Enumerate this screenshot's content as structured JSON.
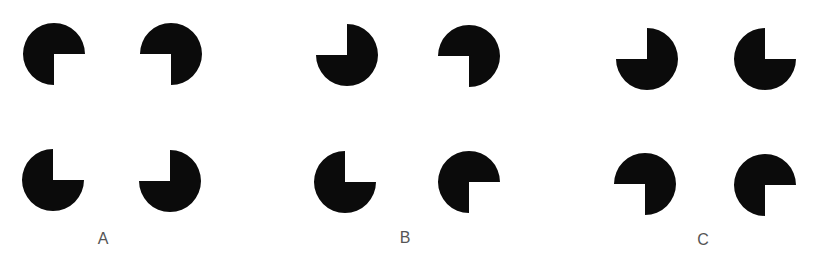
{
  "figure": {
    "fill_color": "#0b0b0b",
    "background_color": "#ffffff",
    "label_color": "#555555",
    "radius": 31
  },
  "panels": [
    {
      "label": "A",
      "label_x": 103,
      "label_y": 231,
      "arrangement": "notches face inward (illusory square)",
      "inducers": [
        {
          "position": "top-left",
          "cx": 54,
          "cy": 54,
          "missing_quadrant": "bottom-right"
        },
        {
          "position": "top-right",
          "cx": 171,
          "cy": 54,
          "missing_quadrant": "bottom-left"
        },
        {
          "position": "bottom-left",
          "cx": 53,
          "cy": 180,
          "missing_quadrant": "top-right"
        },
        {
          "position": "bottom-right",
          "cx": 170,
          "cy": 181,
          "missing_quadrant": "top-left"
        }
      ]
    },
    {
      "label": "B",
      "label_x": 405,
      "label_y": 230,
      "arrangement": "mixed notch orientations",
      "inducers": [
        {
          "position": "top-left",
          "cx": 347,
          "cy": 55,
          "missing_quadrant": "top-left"
        },
        {
          "position": "top-right",
          "cx": 469,
          "cy": 56,
          "missing_quadrant": "bottom-left"
        },
        {
          "position": "bottom-left",
          "cx": 345,
          "cy": 182,
          "missing_quadrant": "top-right"
        },
        {
          "position": "bottom-right",
          "cx": 469,
          "cy": 182,
          "missing_quadrant": "bottom-right"
        }
      ]
    },
    {
      "label": "C",
      "label_x": 703,
      "label_y": 232,
      "arrangement": "notches face outward",
      "inducers": [
        {
          "position": "top-left",
          "cx": 647,
          "cy": 59,
          "missing_quadrant": "top-left"
        },
        {
          "position": "top-right",
          "cx": 765,
          "cy": 59,
          "missing_quadrant": "top-right"
        },
        {
          "position": "bottom-left",
          "cx": 645,
          "cy": 184,
          "missing_quadrant": "bottom-left"
        },
        {
          "position": "bottom-right",
          "cx": 765,
          "cy": 185,
          "missing_quadrant": "bottom-right"
        }
      ]
    }
  ]
}
